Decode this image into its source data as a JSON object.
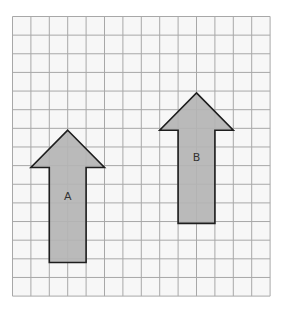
{
  "diagram": {
    "type": "grid-with-shapes",
    "grid": {
      "origin_px": [
        12.5,
        16.5
      ],
      "cell_w_px": 18.4,
      "cell_h_px": 18.64,
      "cols": 14,
      "rows": 15,
      "line_color": "#a8a8a8",
      "background": "#f7f7f7"
    },
    "shapes": [
      {
        "id": "arrow-a",
        "label": "A",
        "direction": "up",
        "fill": "#b4b4b4",
        "stroke": "#1e1e1e",
        "tip": [
          3,
          6.1
        ],
        "head_left": 1,
        "head_right": 5,
        "head_base_y": 8.1,
        "shaft_left": 2,
        "shaft_right": 4,
        "shaft_bottom": 13.2,
        "label_pos": [
          3,
          9.7
        ]
      },
      {
        "id": "arrow-b",
        "label": "B",
        "direction": "up",
        "fill": "#b4b4b4",
        "stroke": "#1e1e1e",
        "tip": [
          10,
          4.1
        ],
        "head_left": 8,
        "head_right": 12,
        "head_base_y": 6.1,
        "shaft_left": 9,
        "shaft_right": 11,
        "shaft_bottom": 11.1,
        "label_pos": [
          10,
          7.6
        ]
      }
    ]
  }
}
